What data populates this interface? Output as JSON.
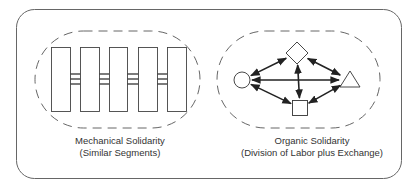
{
  "diagram": {
    "left_panel": {
      "title": "Mechanical Solidarity",
      "subtitle": "(Similar Segments)",
      "segments": [
        {
          "x": 51,
          "w": 19
        },
        {
          "x": 80,
          "w": 19
        },
        {
          "x": 109,
          "w": 18
        },
        {
          "x": 138,
          "w": 19
        },
        {
          "x": 167,
          "w": 19
        }
      ],
      "segment_top": 47,
      "segment_height": 64,
      "connector_lines_y": [
        74,
        79,
        84
      ],
      "boundary": {
        "x": 35,
        "y": 31,
        "w": 165,
        "h": 97
      }
    },
    "right_panel": {
      "title": "Organic Solidarity",
      "subtitle": "(Division of Labor plus Exchange)",
      "nodes": [
        {
          "id": "circle",
          "shape": "circle",
          "cx": 242,
          "cy": 80
        },
        {
          "id": "diamond",
          "shape": "diamond",
          "cx": 297,
          "cy": 53
        },
        {
          "id": "triangle",
          "shape": "triangle",
          "cx": 350,
          "cy": 80
        },
        {
          "id": "square",
          "shape": "square",
          "cx": 300,
          "cy": 108
        }
      ],
      "edges": [
        {
          "from": "circle",
          "to": "diamond",
          "bidirectional": true
        },
        {
          "from": "circle",
          "to": "triangle",
          "bidirectional": true
        },
        {
          "from": "circle",
          "to": "square",
          "bidirectional": true
        },
        {
          "from": "diamond",
          "to": "triangle",
          "bidirectional": true
        },
        {
          "from": "diamond",
          "to": "square",
          "bidirectional": true
        },
        {
          "from": "square",
          "to": "triangle",
          "bidirectional": true
        }
      ],
      "boundary": {
        "x": 217,
        "y": 31,
        "w": 163,
        "h": 97
      }
    },
    "colors": {
      "stroke": "#333333",
      "frame": "#555555",
      "background": "#ffffff"
    }
  }
}
